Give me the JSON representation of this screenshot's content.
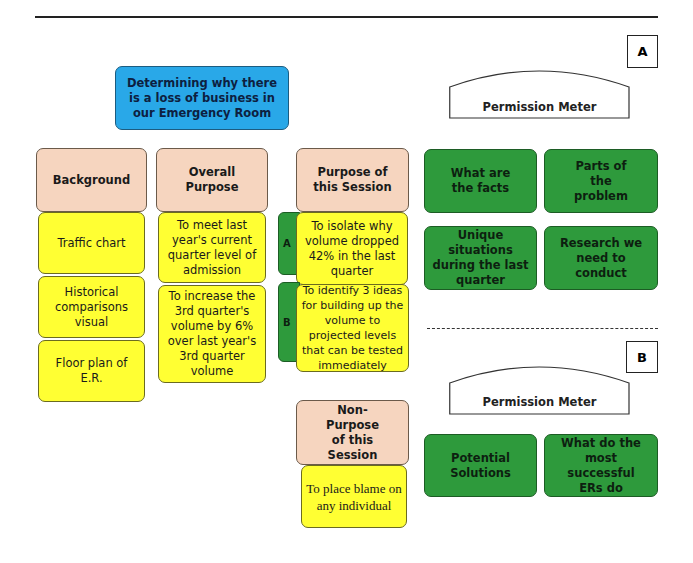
{
  "title": "Determining why there is a loss of business in our Emergency Room",
  "columns": [
    {
      "header": "Background",
      "items": [
        "Traffic chart",
        "Historical comparisons visual",
        "Floor plan of E.R."
      ]
    },
    {
      "header": "Overall Purpose",
      "items": [
        "To meet last year's current quarter level of admission",
        "To increase the 3rd quarter's volume by 6% over last  year's 3rd quarter volume"
      ]
    },
    {
      "header": "Purpose of this Session",
      "items": [
        {
          "tab": "A",
          "text": "To isolate why volume dropped 42% in the last quarter"
        },
        {
          "tab": "B",
          "text": "To identify 3 ideas for building up the volume to projected levels that can be tested immediately"
        }
      ]
    },
    {
      "header": "Non-Purpose of this Session",
      "items": [
        "To place blame on any individual"
      ]
    }
  ],
  "section_a": {
    "label": "A",
    "meter_label": "Permission Meter",
    "boxes": [
      "What are the facts",
      "Parts of the problem",
      "Unique situations during the last quarter",
      "Research we need to conduct"
    ]
  },
  "section_b": {
    "label": "B",
    "meter_label": "Permission Meter",
    "boxes": [
      "Potential Solutions",
      "What do the most successful ERs do"
    ]
  },
  "colors": {
    "title_box": "#29a8e8",
    "header_box": "#f6d5bf",
    "item_box": "#ffff33",
    "green_box": "#2e9a3c"
  }
}
